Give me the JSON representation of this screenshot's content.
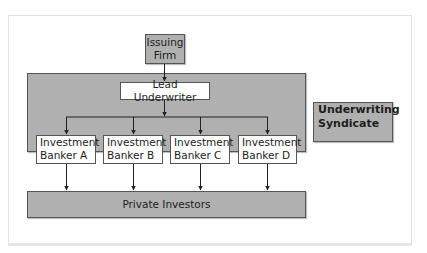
{
  "diagram": {
    "issuing_firm": "Issuing Firm",
    "issuing_firm_lines": [
      "Issuing",
      "Firm"
    ],
    "lead_underwriter": "Lead Underwriter",
    "bankers": [
      {
        "line1": "Investment",
        "line2": "Banker A"
      },
      {
        "line1": "Investment",
        "line2": "Banker B"
      },
      {
        "line1": "Investment",
        "line2": "Banker C"
      },
      {
        "line1": "Investment",
        "line2": "Banker D"
      }
    ],
    "private_investors": "Private Investors",
    "syndicate_label_lines": [
      "Underwriting",
      "Syndicate"
    ],
    "colors": {
      "box_fill": "#b0b0b0",
      "box_border": "#555555",
      "line": "#222222"
    }
  }
}
